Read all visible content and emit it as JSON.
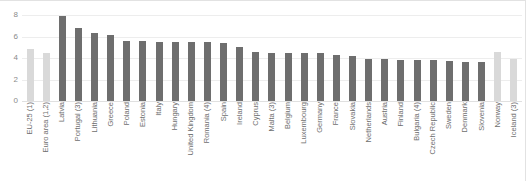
{
  "chart_data": {
    "type": "bar",
    "title": "",
    "subtitle": "",
    "xlabel": "",
    "ylabel": "",
    "ylim": [
      0,
      8
    ],
    "yticks": [
      0,
      2,
      4,
      6,
      8
    ],
    "grid": true,
    "legend": false,
    "legend_position": "none",
    "colors": {
      "aggregate_bar": "#d9d9d9",
      "country_bar": "#6e6e6e",
      "gridline": "#ededed",
      "axis_text": "#8a8a8a",
      "label_text": "#6e6e6e"
    },
    "categories": [
      "EU-25 (1)",
      "Euro area (1,2)",
      "Latvia",
      "Portugal (3)",
      "Lithuania",
      "Greece",
      "Poland",
      "Estonia",
      "Italy",
      "Hungary",
      "United Kingdom",
      "Romania (4)",
      "Spain",
      "Ireland",
      "Cyprus",
      "Malta (3)",
      "Belgium",
      "Luxembourg",
      "Germany",
      "France",
      "Slovakia",
      "Netherlands",
      "Austria",
      "Finland",
      "Bulgaria (4)",
      "Czech Republic",
      "Sweden",
      "Denmark",
      "Slovenia",
      "Norway",
      "Iceland (3)"
    ],
    "values": [
      4.8,
      4.5,
      7.9,
      6.8,
      6.3,
      6.1,
      5.6,
      5.6,
      5.5,
      5.5,
      5.5,
      5.5,
      5.4,
      5.0,
      4.6,
      4.5,
      4.5,
      4.5,
      4.5,
      4.3,
      4.2,
      3.9,
      3.9,
      3.8,
      3.8,
      3.8,
      3.7,
      3.6,
      3.6,
      4.6,
      3.9
    ],
    "series_kind": [
      "aggregate",
      "aggregate",
      "country",
      "country",
      "country",
      "country",
      "country",
      "country",
      "country",
      "country",
      "country",
      "country",
      "country",
      "country",
      "country",
      "country",
      "country",
      "country",
      "country",
      "country",
      "country",
      "country",
      "country",
      "country",
      "country",
      "country",
      "country",
      "country",
      "country",
      "aggregate",
      "aggregate"
    ]
  }
}
